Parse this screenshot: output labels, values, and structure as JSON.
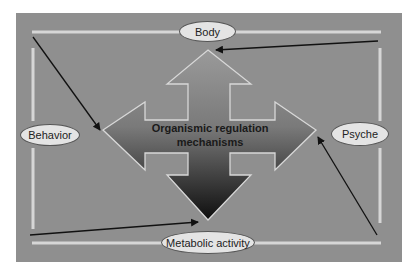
{
  "diagram": {
    "center": {
      "line1": "Organismic regulation",
      "line2": "mechanisms"
    },
    "nodes": {
      "top": "Body",
      "left": "Behavior",
      "right": "Psyche",
      "bottom": "Metabolic activity"
    },
    "edges": [
      {
        "from": "top-left corner",
        "to": "center-arrow-left",
        "label": ""
      },
      {
        "from": "top-right corner",
        "to": "center-arrow-top",
        "label": ""
      },
      {
        "from": "bottom-left corner",
        "to": "center-arrow-bottom",
        "label": ""
      },
      {
        "from": "bottom-right corner",
        "to": "center-arrow-right",
        "label": ""
      }
    ],
    "colors": {
      "background": "#8f8f8f",
      "frame_lines": "#d9d9d9",
      "node_fill": "#e4e4e4",
      "arrow_dark": "#151515",
      "connector": "#111111"
    }
  }
}
